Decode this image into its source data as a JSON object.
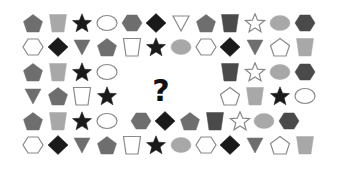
{
  "puzzle": {
    "question_mark": "?",
    "colors": {
      "black": "#1a1a1a",
      "dark": "#4a4a4a",
      "gray": "#6e6e6e",
      "light": "#a8a8a8",
      "outline_stroke": "#8a8a8a",
      "background": "#ffffff"
    },
    "grid": {
      "cols": 12,
      "rows": 6,
      "missing_region": {
        "row_start": 2,
        "row_end": 3,
        "col_start": 4,
        "col_end": 7
      }
    },
    "rows": [
      [
        {
          "shape": "pentagon",
          "fill": "gray"
        },
        {
          "shape": "trapezoid",
          "fill": "light"
        },
        {
          "shape": "star",
          "fill": "black"
        },
        {
          "shape": "ellipse",
          "fill": "outline"
        },
        {
          "shape": "hexagon",
          "fill": "gray"
        },
        {
          "shape": "diamond",
          "fill": "black"
        },
        {
          "shape": "triangle",
          "fill": "outline"
        },
        {
          "shape": "pentagon",
          "fill": "gray"
        },
        {
          "shape": "trapezoid",
          "fill": "dark"
        },
        {
          "shape": "star",
          "fill": "outline"
        },
        {
          "shape": "ellipse",
          "fill": "light"
        },
        {
          "shape": "hexagon",
          "fill": "dark"
        }
      ],
      [
        {
          "shape": "hexagon",
          "fill": "outline"
        },
        {
          "shape": "diamond",
          "fill": "black"
        },
        {
          "shape": "triangle",
          "fill": "gray"
        },
        {
          "shape": "pentagon",
          "fill": "gray"
        },
        {
          "shape": "trapezoid",
          "fill": "outline"
        },
        {
          "shape": "star",
          "fill": "black"
        },
        {
          "shape": "ellipse",
          "fill": "light"
        },
        {
          "shape": "hexagon",
          "fill": "outline"
        },
        {
          "shape": "diamond",
          "fill": "black"
        },
        {
          "shape": "triangle",
          "fill": "gray"
        },
        {
          "shape": "pentagon",
          "fill": "outline"
        },
        {
          "shape": "trapezoid",
          "fill": "light"
        }
      ],
      [
        {
          "shape": "pentagon",
          "fill": "gray"
        },
        {
          "shape": "trapezoid",
          "fill": "light"
        },
        {
          "shape": "star",
          "fill": "black"
        },
        {
          "shape": "ellipse",
          "fill": "outline"
        },
        null,
        null,
        null,
        null,
        {
          "shape": "trapezoid",
          "fill": "dark"
        },
        {
          "shape": "star",
          "fill": "outline"
        },
        {
          "shape": "ellipse",
          "fill": "light"
        },
        {
          "shape": "hexagon",
          "fill": "dark"
        }
      ],
      [
        {
          "shape": "triangle",
          "fill": "gray"
        },
        {
          "shape": "pentagon",
          "fill": "gray"
        },
        {
          "shape": "trapezoid",
          "fill": "outline"
        },
        {
          "shape": "star",
          "fill": "black"
        },
        null,
        null,
        null,
        null,
        {
          "shape": "pentagon",
          "fill": "outline"
        },
        {
          "shape": "trapezoid",
          "fill": "light"
        },
        {
          "shape": "star",
          "fill": "black"
        },
        {
          "shape": "ellipse",
          "fill": "outline"
        }
      ],
      [
        {
          "shape": "pentagon",
          "fill": "gray"
        },
        {
          "shape": "trapezoid",
          "fill": "light"
        },
        {
          "shape": "star",
          "fill": "black"
        },
        {
          "shape": "ellipse",
          "fill": "outline"
        },
        {
          "shape": "hexagon",
          "fill": "gray"
        },
        {
          "shape": "diamond",
          "fill": "black"
        },
        {
          "shape": "pentagon",
          "fill": "gray"
        },
        {
          "shape": "trapezoid",
          "fill": "dark"
        },
        {
          "shape": "star",
          "fill": "outline"
        },
        {
          "shape": "ellipse",
          "fill": "light"
        },
        {
          "shape": "hexagon",
          "fill": "dark"
        },
        null
      ],
      [
        {
          "shape": "hexagon",
          "fill": "outline"
        },
        {
          "shape": "diamond",
          "fill": "black"
        },
        {
          "shape": "triangle",
          "fill": "gray"
        },
        {
          "shape": "pentagon",
          "fill": "gray"
        },
        {
          "shape": "trapezoid",
          "fill": "outline"
        },
        {
          "shape": "star",
          "fill": "black"
        },
        {
          "shape": "ellipse",
          "fill": "light"
        },
        {
          "shape": "hexagon",
          "fill": "outline"
        },
        {
          "shape": "diamond",
          "fill": "black"
        },
        {
          "shape": "triangle",
          "fill": "gray"
        },
        {
          "shape": "pentagon",
          "fill": "outline"
        },
        {
          "shape": "trapezoid",
          "fill": "light"
        }
      ]
    ]
  }
}
